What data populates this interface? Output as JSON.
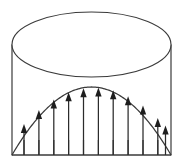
{
  "figure": {
    "background_color": "#ffffff",
    "line_color": "#3a3a3a",
    "arrow_color": "#1e1e1e"
  },
  "canvas": {
    "width": 183,
    "height": 164
  },
  "cylinder": {
    "name": "cylinder",
    "left_x": 12,
    "right_x": 171,
    "top_ellipse": {
      "center_x": 91.5,
      "center_y": 44.5,
      "radius_x": 79.5,
      "radius_y": 32.5
    },
    "wall_top_y": 44.5,
    "wall_bottom_y": 155
  },
  "baseline": {
    "name": "baseline",
    "y": 155,
    "x_start": 12,
    "x_end": 171
  },
  "profile_curve": {
    "name": "parabolic-velocity-profile",
    "shape": "parabola",
    "left_x": 12,
    "right_x": 171,
    "base_y": 155,
    "apex_x": 91.5,
    "apex_y": 87,
    "max_amplitude": 68
  },
  "vectors": {
    "name": "velocity-vectors",
    "count": 11,
    "base_y": 155,
    "head_width": 6.4,
    "head_length": 9,
    "items": [
      {
        "index": 1,
        "x": 24.0,
        "tip_y": 123.9,
        "length": 31.1
      },
      {
        "index": 2,
        "x": 38.9,
        "tip_y": 110.0,
        "length": 45.0
      },
      {
        "index": 3,
        "x": 53.8,
        "tip_y": 99.5,
        "length": 55.5
      },
      {
        "index": 4,
        "x": 68.6,
        "tip_y": 92.2,
        "length": 62.8
      },
      {
        "index": 5,
        "x": 83.5,
        "tip_y": 88.2,
        "length": 66.8
      },
      {
        "index": 6,
        "x": 98.4,
        "tip_y": 87.6,
        "length": 67.4
      },
      {
        "index": 7,
        "x": 113.2,
        "tip_y": 90.2,
        "length": 64.8
      },
      {
        "index": 8,
        "x": 128.1,
        "tip_y": 96.2,
        "length": 58.8
      },
      {
        "index": 9,
        "x": 143.0,
        "tip_y": 105.4,
        "length": 49.6
      },
      {
        "index": 10,
        "x": 157.8,
        "tip_y": 118.0,
        "length": 37.0
      },
      {
        "index": 11,
        "x": 165.5,
        "tip_y": 125.6,
        "length": 29.4
      }
    ]
  },
  "ticks": {
    "name": "base-tick-marks",
    "top_y": 140,
    "bottom_y": 155,
    "x_positions": [
      24.0,
      38.9,
      53.8,
      68.6,
      83.5,
      98.4,
      113.2,
      128.1,
      143.0,
      157.8
    ]
  }
}
